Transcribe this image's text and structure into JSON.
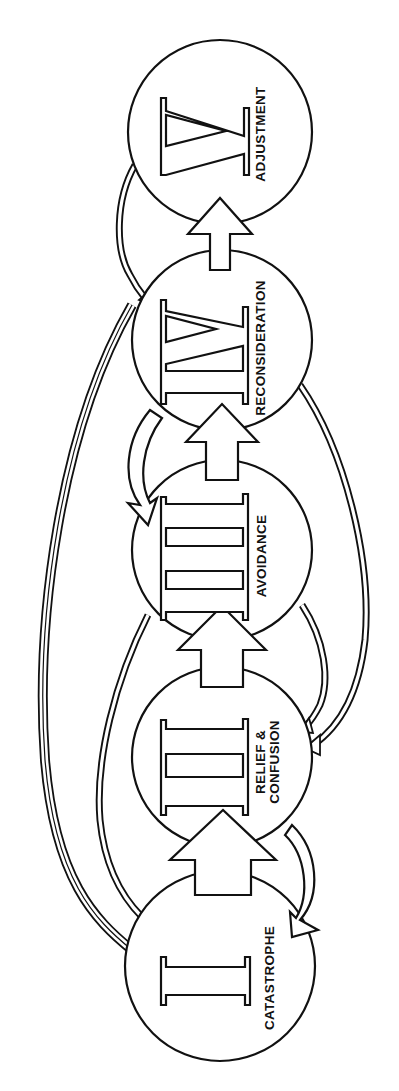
{
  "diagram": {
    "orientation": "rotated-90-ccw",
    "stages": [
      {
        "numeral": "I",
        "label_lines": [
          "CATASTROPHE"
        ]
      },
      {
        "numeral": "II",
        "label_lines": [
          "RELIEF &",
          "CONFUSION"
        ]
      },
      {
        "numeral": "III",
        "label_lines": [
          "AVOIDANCE"
        ]
      },
      {
        "numeral": "IV",
        "label_lines": [
          "RECONSIDERATION"
        ]
      },
      {
        "numeral": "V",
        "label_lines": [
          "ADJUSTMENT"
        ]
      }
    ],
    "forward_arrows": [
      {
        "from": "I",
        "to": "II"
      },
      {
        "from": "II",
        "to": "III"
      },
      {
        "from": "III",
        "to": "IV"
      },
      {
        "from": "IV",
        "to": "V"
      }
    ],
    "return_arrows": [
      {
        "from": "II",
        "to": "I",
        "style": "broad"
      },
      {
        "from": "IV",
        "to": "III",
        "style": "broad"
      },
      {
        "from": "III",
        "to": "II",
        "style": "double-line"
      },
      {
        "from": "IV",
        "to": "II",
        "style": "double-line"
      },
      {
        "from": "IV",
        "to": "I",
        "style": "double-line"
      },
      {
        "from": "III",
        "to": "I",
        "style": "double-line"
      },
      {
        "from": "V",
        "to": "IV",
        "style": "double-line"
      }
    ],
    "colors": {
      "line": "#111111",
      "background": "#ffffff"
    }
  }
}
